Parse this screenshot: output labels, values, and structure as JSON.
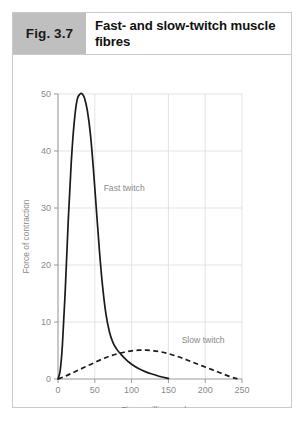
{
  "figure": {
    "number_label": "Fig. 3.7",
    "title": "Fast- and slow-twitch muscle fibres",
    "box_color": "#bfbfbf",
    "border_color": "#c9c9c9"
  },
  "chart_data": {
    "type": "line",
    "title": "",
    "xlabel": "Time, milliseconds",
    "ylabel": "Force of contraction",
    "xlim": [
      0,
      250
    ],
    "ylim": [
      0,
      50
    ],
    "xticks": [
      0,
      50,
      100,
      150,
      200,
      250
    ],
    "yticks": [
      0,
      10,
      20,
      30,
      40,
      50
    ],
    "xtick_labels": [
      "0",
      "50",
      "100",
      "150",
      "200",
      "250"
    ],
    "ytick_labels": [
      "0",
      "10",
      "20",
      "30",
      "40",
      "50"
    ],
    "grid": true,
    "legend_position": "inline-annotations",
    "series": [
      {
        "name": "Fast twitch",
        "style": "solid",
        "color": "#1a1a1a",
        "annotation": "Fast twitch",
        "annotation_x": 62,
        "annotation_y": 33,
        "x": [
          0,
          3,
          6,
          10,
          14,
          18,
          22,
          26,
          30,
          33,
          36,
          40,
          44,
          48,
          52,
          56,
          60,
          65,
          70,
          75,
          80,
          85,
          90,
          95,
          100,
          110,
          120,
          130,
          140,
          150
        ],
        "y": [
          0,
          1.5,
          6,
          16,
          28,
          38,
          45,
          49,
          50,
          50,
          49.3,
          47,
          43,
          37,
          30,
          23,
          17,
          11.5,
          8.2,
          6.3,
          5.2,
          4.4,
          3.7,
          3.1,
          2.6,
          1.8,
          1.2,
          0.8,
          0.4,
          0.1
        ]
      },
      {
        "name": "Slow twitch",
        "style": "dashed",
        "color": "#1a1a1a",
        "annotation": "Slow twitch",
        "annotation_x": 168,
        "annotation_y": 6.4,
        "x": [
          0,
          10,
          20,
          30,
          40,
          50,
          60,
          70,
          80,
          90,
          100,
          110,
          120,
          130,
          140,
          150,
          160,
          170,
          180,
          190,
          200,
          210,
          220,
          230,
          240,
          246
        ],
        "y": [
          0,
          0.5,
          1.1,
          1.7,
          2.3,
          2.9,
          3.5,
          4.0,
          4.4,
          4.7,
          4.95,
          5.05,
          5.05,
          4.95,
          4.75,
          4.45,
          4.05,
          3.6,
          3.1,
          2.6,
          2.1,
          1.6,
          1.1,
          0.6,
          0.15,
          0
        ]
      }
    ]
  }
}
